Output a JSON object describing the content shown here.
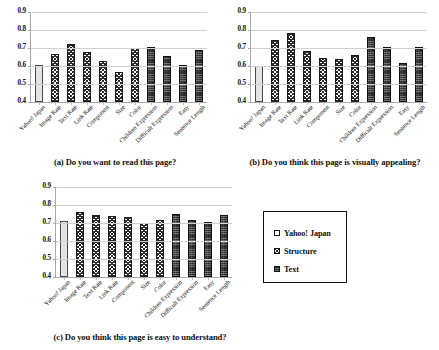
{
  "figure": {
    "background": "#ffffff",
    "axis_color": "#a9a9a9",
    "grid_color": "#d0d0d0"
  },
  "legend": {
    "position": "bottom-right",
    "items": [
      {
        "label": "Yahoo! Japan",
        "swatch": "light-gray-outline",
        "color": "#e4e4e4"
      },
      {
        "label": "Structure",
        "swatch": "crosshatch",
        "color": "#2b2b2b"
      },
      {
        "label": "Text",
        "swatch": "dark-solid",
        "color": "#2c2c2c"
      }
    ]
  },
  "series_order": [
    "Yahoo! Japan",
    "Structure",
    "Structure",
    "Structure",
    "Structure",
    "Structure",
    "Structure",
    "Text",
    "Text",
    "Text",
    "Text"
  ],
  "categories": [
    "Yahoo! Japan",
    "Image Rate",
    "Text Rate",
    "Link Rate",
    "Component",
    "Size",
    "Color",
    "Children Expression",
    "Difficult Expression",
    "Easy",
    "Sentence Length"
  ],
  "yticks": [
    "0.9",
    "0.8",
    "0.7",
    "0.6",
    "0.5",
    "0.4"
  ],
  "chart_data": [
    {
      "type": "bar",
      "id": "a",
      "title": "(a) Do you want to read this page?",
      "xlabel": "",
      "ylabel": "",
      "ylim": [
        0.4,
        0.9
      ],
      "grid": true,
      "legend": "external",
      "categories": [
        "Yahoo! Japan",
        "Image Rate",
        "Text Rate",
        "Link Rate",
        "Component",
        "Size",
        "Color",
        "Children Expression",
        "Difficult Expression",
        "Easy",
        "Sentence Length"
      ],
      "groups": [
        "Yahoo! Japan",
        "Structure",
        "Structure",
        "Structure",
        "Structure",
        "Structure",
        "Structure",
        "Text",
        "Text",
        "Text",
        "Text"
      ],
      "values": [
        0.603,
        0.666,
        0.722,
        0.68,
        0.628,
        0.568,
        0.698,
        0.708,
        0.655,
        0.608,
        0.687
      ]
    },
    {
      "type": "bar",
      "id": "b",
      "title": "(b) Do you think this page is visually appealing?",
      "xlabel": "",
      "ylabel": "",
      "ylim": [
        0.4,
        0.9
      ],
      "grid": true,
      "legend": "external",
      "categories": [
        "Yahoo! Japan",
        "Image Rate",
        "Text Rate",
        "Link Rate",
        "Component",
        "Size",
        "Color",
        "Children Expression",
        "Difficult Expression",
        "Easy",
        "Sentence Length"
      ],
      "groups": [
        "Yahoo! Japan",
        "Structure",
        "Structure",
        "Structure",
        "Structure",
        "Structure",
        "Structure",
        "Text",
        "Text",
        "Text",
        "Text"
      ],
      "values": [
        0.598,
        0.744,
        0.786,
        0.681,
        0.643,
        0.637,
        0.663,
        0.762,
        0.705,
        0.616,
        0.704
      ]
    },
    {
      "type": "bar",
      "id": "c",
      "title": "(c) Do you think this page is easy to understand?",
      "xlabel": "",
      "ylabel": "",
      "ylim": [
        0.4,
        0.9
      ],
      "grid": true,
      "legend": "external",
      "categories": [
        "Yahoo! Japan",
        "Image Rate",
        "Text Rate",
        "Link Rate",
        "Component",
        "Size",
        "Color",
        "Children Expression",
        "Difficult Expression",
        "Easy",
        "Sentence Length"
      ],
      "groups": [
        "Yahoo! Japan",
        "Structure",
        "Structure",
        "Structure",
        "Structure",
        "Structure",
        "Structure",
        "Text",
        "Text",
        "Text",
        "Text"
      ],
      "values": [
        0.71,
        0.761,
        0.745,
        0.739,
        0.731,
        0.698,
        0.718,
        0.752,
        0.719,
        0.705,
        0.745
      ]
    }
  ]
}
